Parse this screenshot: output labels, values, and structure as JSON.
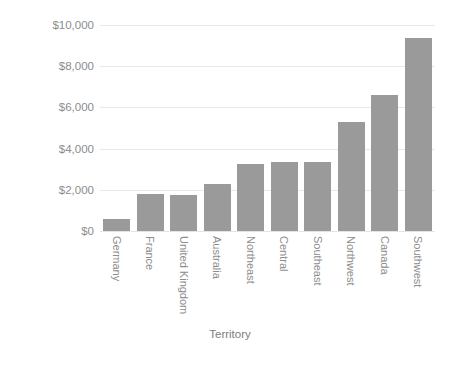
{
  "chart_data": {
    "type": "bar",
    "title": "",
    "subtitle": "",
    "xlabel": "Territory",
    "ylabel": "Sales in thousands",
    "categories": [
      "Germany",
      "France",
      "United Kingdom",
      "Australia",
      "Northeast",
      "Central",
      "Southeast",
      "Northwest",
      "Canada",
      "Southwest"
    ],
    "values": [
      580,
      1800,
      1750,
      2300,
      3250,
      3350,
      3350,
      5300,
      6600,
      9350
    ],
    "series": [
      {
        "name": "Sales",
        "values": [
          580,
          1800,
          1750,
          2300,
          3250,
          3350,
          3350,
          5300,
          6600,
          9350
        ]
      }
    ],
    "ylim": [
      0,
      10000
    ],
    "ytick_values": [
      0,
      2000,
      4000,
      6000,
      8000,
      10000
    ],
    "ytick_labels": [
      "$0",
      "$2,000",
      "$4,000",
      "$6,000",
      "$8,000",
      "$10,000"
    ],
    "grid": true,
    "grid_axis": "y",
    "legend": false,
    "legend_position": "none",
    "bar_color": "#9a9a9a",
    "background_color": "#ffffff",
    "gridline_color": "#e8e8e8",
    "text_color": "#8c8c8c",
    "xtick_label_rotation": 90,
    "annotations": []
  }
}
